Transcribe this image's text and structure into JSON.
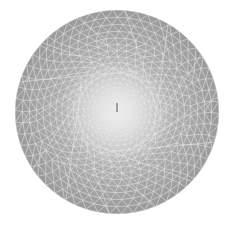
{
  "image": {
    "description": "Triangulated mesh disc with gray cells and white edges, densely refined toward a bright center",
    "background": "#ffffff",
    "disc": {
      "cx": 117,
      "cy": 112,
      "r": 102,
      "fill_outer": "#9a9a9a",
      "fill_inner": "#f4f4f4",
      "edge_color": "#e8e8e8"
    },
    "mesh": {
      "rings": 22,
      "center_marker_color": "#6a6a6a"
    }
  }
}
